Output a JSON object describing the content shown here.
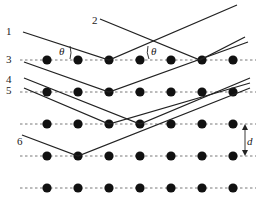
{
  "diagram": {
    "ray_labels": [
      "1",
      "2",
      "3",
      "4",
      "5",
      "6"
    ],
    "angle_label": "θ",
    "spacing_label": "d",
    "rows_y": [
      60,
      92,
      124,
      156,
      188
    ],
    "dots_x": [
      47,
      78,
      109,
      140,
      171,
      202,
      233
    ],
    "rays": [
      {
        "label": "1",
        "start": [
          23,
          32
        ],
        "hit": [
          109,
          60
        ],
        "end": [
          237,
          5
        ]
      },
      {
        "label": "2",
        "start": [
          100,
          19
        ],
        "hit": [
          200,
          60
        ],
        "end": [
          245,
          37
        ]
      },
      {
        "label": "3",
        "start": [
          24,
          62
        ],
        "hit": [
          109,
          92
        ],
        "end": [
          248,
          42
        ]
      },
      {
        "label": "4",
        "start": [
          24,
          78
        ],
        "hit": [
          140,
          124
        ],
        "end": [
          250,
          78
        ]
      },
      {
        "label": "5",
        "start": [
          24,
          88
        ],
        "hit": [
          109,
          124
        ],
        "end": [
          250,
          83
        ]
      },
      {
        "label": "6",
        "start": [
          22,
          135
        ],
        "hit": [
          78,
          156
        ],
        "end": [
          250,
          88
        ]
      }
    ]
  }
}
